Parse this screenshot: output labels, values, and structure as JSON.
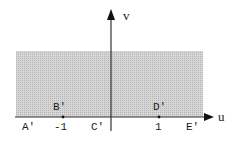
{
  "diagram": {
    "type": "complex-plane-mapping",
    "axes": {
      "horizontal_label": "u",
      "vertical_label": "v"
    },
    "region": {
      "description": "upper half-plane (shaded)",
      "fill_color": "#c8c8c8"
    },
    "points_above_axis": [
      {
        "label": "B'",
        "value": -1
      },
      {
        "label": "D'",
        "value": 1
      }
    ],
    "labels_below_axis": [
      {
        "label": "A'"
      },
      {
        "label": "-1"
      },
      {
        "label": "C'"
      },
      {
        "label": "1"
      },
      {
        "label": "E'"
      }
    ]
  }
}
